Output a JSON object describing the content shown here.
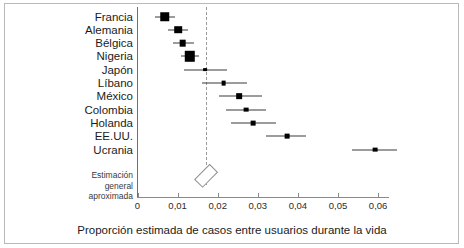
{
  "chart_data": {
    "type": "scatter",
    "subtype": "forest-plot",
    "title": "",
    "xlabel": "Proporción estimada de casos entre usuarios durante la vida",
    "ylabel": "",
    "xlim": [
      0,
      0.0655
    ],
    "xticks": [
      0,
      0.01,
      0.02,
      0.03,
      0.04,
      0.05,
      0.06
    ],
    "xticklabels": [
      "0",
      "0,01",
      "0,02",
      "0,03",
      "0,04",
      "0,05",
      "0,06"
    ],
    "grid": false,
    "legend": null,
    "reference_line": {
      "value": 0.0172,
      "style": "dashed",
      "color": "#9a9a9a"
    },
    "categories": [
      "Francia",
      "Alemania",
      "Bélgica",
      "Nigeria",
      "Japón",
      "Líbano",
      "México",
      "Colombia",
      "Holanda",
      "EE.UU.",
      "Ucrania"
    ],
    "points": [
      {
        "label": "Francia",
        "value": 0.0068,
        "ci_low": 0.0044,
        "ci_high": 0.0094,
        "weight": 10
      },
      {
        "label": "Alemania",
        "value": 0.0101,
        "ci_low": 0.0077,
        "ci_high": 0.0127,
        "weight": 8
      },
      {
        "label": "Bélgica",
        "value": 0.0113,
        "ci_low": 0.0088,
        "ci_high": 0.014,
        "weight": 7
      },
      {
        "label": "Nigeria",
        "value": 0.0131,
        "ci_low": 0.0108,
        "ci_high": 0.0154,
        "weight": 11
      },
      {
        "label": "Japón",
        "value": 0.0168,
        "ci_low": 0.0115,
        "ci_high": 0.0223,
        "weight": 4
      },
      {
        "label": "Líbano",
        "value": 0.0215,
        "ci_low": 0.0162,
        "ci_high": 0.0272,
        "weight": 5
      },
      {
        "label": "México",
        "value": 0.0254,
        "ci_low": 0.0203,
        "ci_high": 0.031,
        "weight": 6
      },
      {
        "label": "Colombia",
        "value": 0.027,
        "ci_low": 0.022,
        "ci_high": 0.032,
        "weight": 5
      },
      {
        "label": "Holanda",
        "value": 0.0288,
        "ci_low": 0.0232,
        "ci_high": 0.0345,
        "weight": 5
      },
      {
        "label": "EE.UU.",
        "value": 0.0373,
        "ci_low": 0.0321,
        "ci_high": 0.042,
        "weight": 5
      },
      {
        "label": "Ucrania",
        "value": 0.0592,
        "ci_low": 0.0535,
        "ci_high": 0.0648,
        "weight": 5
      }
    ],
    "summary": {
      "label": "Estimación general aproximada",
      "value": 0.0172,
      "ci_low": 0.0155,
      "ci_high": 0.019,
      "shape": "diamond"
    }
  },
  "axis": {
    "x_title": "Proporción estimada de casos entre usuarios durante la vida"
  },
  "overall": {
    "line1": "Estimación",
    "line2": "general",
    "line3": "aproximada"
  }
}
